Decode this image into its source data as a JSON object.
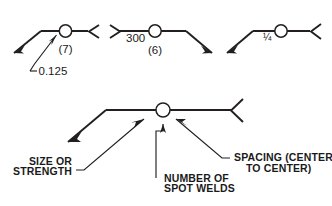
{
  "figure": {
    "ink_color": "#231f20",
    "background": "#ffffff"
  },
  "examples": [
    {
      "id": "example-left",
      "size_or_strength": "0.125",
      "number_of_spot_welds": "(7)",
      "spacing": "",
      "arrow_direction": "down-left",
      "has_tail": true
    },
    {
      "id": "example-middle",
      "size_or_strength": "",
      "number_of_spot_welds": "(6)",
      "spacing": "300",
      "arrow_direction": "down-right",
      "has_tail": true
    },
    {
      "id": "example-right",
      "size_or_strength": "¼",
      "number_of_spot_welds": "",
      "spacing": "",
      "arrow_direction": "down-left",
      "has_tail": true
    }
  ],
  "legend": {
    "size_or_strength": {
      "line1": "SIZE OR",
      "line2": "STRENGTH"
    },
    "number_of_spot_welds": {
      "line1": "NUMBER OF",
      "line2": "SPOT WELDS"
    },
    "spacing": {
      "line1": "SPACING (CENTER",
      "line2": "TO CENTER)"
    }
  }
}
